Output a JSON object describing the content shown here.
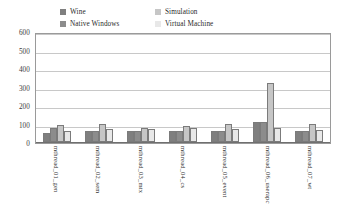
{
  "chart_data": {
    "type": "bar",
    "title": "",
    "subtitle": "",
    "xlabel": "",
    "ylabel": "",
    "ylim": [
      0,
      600
    ],
    "yticks": [
      0,
      100,
      200,
      300,
      400,
      500,
      600
    ],
    "ytick_labels": [
      "0",
      "100",
      "200",
      "300",
      "400",
      "500",
      "600"
    ],
    "grid": true,
    "legend_position": "top",
    "categories": [
      "mthread_01_gen",
      "mthread_02_sem",
      "mthread_03_mtx",
      "mthread_04_cs",
      "mthread_05_event",
      "mthread_06_userapc",
      "mthread_07_wt"
    ],
    "series": [
      {
        "name": "Wine",
        "color": "#7f7f7f",
        "values": [
          50,
          62,
          60,
          62,
          58,
          110,
          58
        ]
      },
      {
        "name": "Native Windows",
        "color": "#8c8c8c",
        "values": [
          78,
          62,
          60,
          62,
          58,
          110,
          58
        ]
      },
      {
        "name": "Simulation",
        "color": "#c6c6c6",
        "values": [
          92,
          95,
          78,
          88,
          100,
          320,
          98
        ]
      },
      {
        "name": "Virtual Machine",
        "color": "#e8e8e8",
        "values": [
          60,
          70,
          70,
          74,
          70,
          74,
          66
        ]
      }
    ]
  },
  "legend": {
    "items": [
      {
        "label": "Wine",
        "swatch": "#7f7f7f"
      },
      {
        "label": "Simulation",
        "swatch": "#c6c6c6"
      },
      {
        "label": "Native Windows",
        "swatch": "#8c8c8c"
      },
      {
        "label": "Virtual Machine",
        "swatch": "#e8e8e8"
      }
    ]
  },
  "colors": {
    "background": "#ffffff",
    "plot_border": "#9a9a9a",
    "gridline": "#c8c8c8",
    "text": "#323232"
  }
}
